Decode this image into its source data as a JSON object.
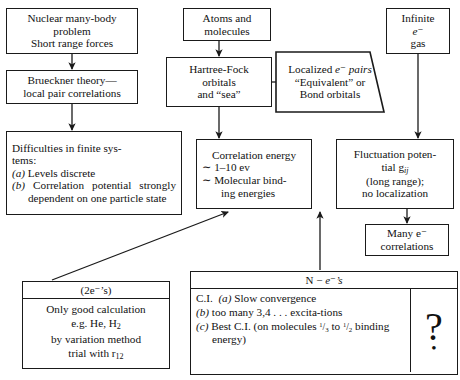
{
  "diagram": {
    "nodes": {
      "nuclear": {
        "l1": "Nuclear many-body",
        "l2": "problem",
        "l3": "Short range forces"
      },
      "brueckner": {
        "l1": "Brueckner theory—",
        "l2": "local pair correlations"
      },
      "difficulties": {
        "l1": "Difficulties in finite sys-",
        "l2": "tems:",
        "a_label": "(a)",
        "a_text": "Levels discrete",
        "b_label": "(b)",
        "b_text": "Correlation potential strongly dependent on one particle state"
      },
      "atoms": {
        "l1": "Atoms and",
        "l2": "molecules"
      },
      "hartree_fock": {
        "l1": "Hartree-Fock",
        "l2": "orbitals",
        "l3": "and “sea”"
      },
      "localized": {
        "l1": "Localized",
        "l2": "e⁻ pairs",
        "l3": "“Equivalent”",
        "l4": "or Bond orbitals"
      },
      "correlation_energy": {
        "l1": "Correlation energy",
        "l2": "∼  1–10 ev",
        "l3": "∼  Molecular bind-",
        "l4": "ing energies"
      },
      "infinite": {
        "l1": "Infinite",
        "l2": "e⁻",
        "l3": "gas"
      },
      "fluctuation": {
        "l1": "Fluctuation poten-",
        "l2": "tial g",
        "l2_sub": "ij",
        "l3": "(long range);",
        "l4": "no localization"
      },
      "many_correlations": {
        "l1": "Many e⁻",
        "l2": "correlations"
      },
      "two_electron": {
        "header": "(2e⁻’s)",
        "l1": "Only good calculation",
        "l2_pre": "e.g. He, H",
        "l2_sub": "2",
        "l3": "by variation method",
        "l4_pre": "trial with r",
        "l4_sub": "12"
      },
      "n_electron": {
        "header_pre": "N − ",
        "header_e": "e⁻’s",
        "a_lead": "C.I.",
        "a_label": "(a)",
        "a_text": "Slow convergence",
        "b_label": "(b)",
        "b_text": "too many 3,4 . . . excita-tions",
        "c_label": "(c)",
        "c_text_1": "Best C.I. (on molecules",
        "c_frac_1": "1/3",
        "c_text_2": "to",
        "c_frac_2": "1/2",
        "c_text_3": "binding energy)",
        "question_mark": "?",
        "question_dot": "•"
      }
    },
    "colors": {
      "stroke": "#1a1a1a",
      "background": "#ffffff",
      "text": "#111111"
    }
  }
}
